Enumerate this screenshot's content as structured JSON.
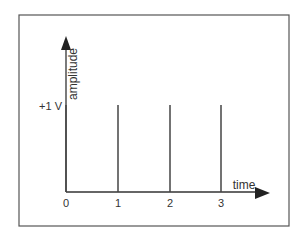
{
  "diagram": {
    "y_axis_label": "amplitude",
    "x_axis_label": "time",
    "level_label": "+1 V",
    "x_ticks": [
      "0",
      "1",
      "2",
      "3"
    ],
    "impulses": [
      {
        "t": "0",
        "amplitude": 1
      },
      {
        "t": "1",
        "amplitude": 1
      },
      {
        "t": "2",
        "amplitude": 1
      },
      {
        "t": "3",
        "amplitude": 1
      }
    ],
    "colors": {
      "frame": "#555555",
      "axis": "#333333",
      "impulse": "#444444",
      "text": "#333333"
    }
  }
}
